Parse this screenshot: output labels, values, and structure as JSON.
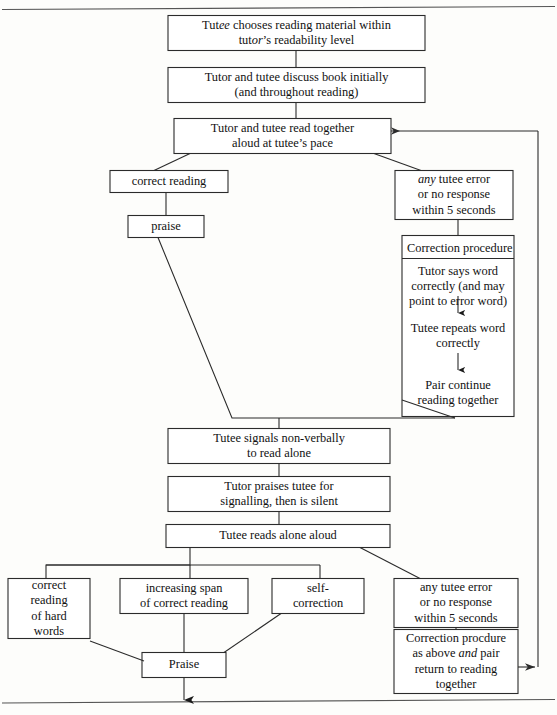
{
  "figure": {
    "line_color": "#2b2b2b",
    "box_fill": "#ffffff",
    "page_rule_color": "#555555"
  },
  "nodes": {
    "choose_material": {
      "lines": [
        "Tutee chooses reading material within",
        "tutor’s readability level"
      ],
      "line1_pre": "Tut",
      "line1_em": "ee",
      "line1_post": " chooses reading material within",
      "line2_pre": "tut",
      "line2_em": "or",
      "line2_post": "’s readability level"
    },
    "discuss_book": {
      "lines": [
        "Tutor and tutee discuss book initially",
        "(and throughout reading)"
      ]
    },
    "read_together": {
      "lines": [
        "Tutor and tutee read together",
        "aloud at tutee’s pace"
      ]
    },
    "correct_reading": {
      "lines": [
        "correct reading"
      ]
    },
    "praise_top": {
      "lines": [
        "praise"
      ]
    },
    "error_top": {
      "em": "any",
      "line1_post": " tutee error",
      "lines": [
        "any tutee error",
        "or no response",
        "within 5 seconds"
      ]
    },
    "correction_procedure": {
      "header": "Correction procedure",
      "steps": [
        [
          "Tutor says word",
          "correctly (and may",
          "point to error word)"
        ],
        [
          "Tutee repeats word",
          "correctly"
        ],
        [
          "Pair continue",
          "reading together"
        ]
      ]
    },
    "signals_nonverbally": {
      "lines": [
        "Tutee signals non-verbally",
        "to read alone"
      ]
    },
    "praises_signal": {
      "lines": [
        "Tutor praises tutee for",
        "signalling, then is silent"
      ]
    },
    "reads_alone": {
      "lines": [
        "Tutee reads alone aloud"
      ]
    },
    "hard_words": {
      "lines": [
        "correct",
        "reading",
        "of hard",
        "words"
      ]
    },
    "increasing_span": {
      "lines": [
        "increasing span",
        "of correct reading"
      ]
    },
    "self_correction": {
      "lines": [
        "self-",
        "correction"
      ]
    },
    "error_bottom": {
      "lines": [
        "any tutee error",
        "or no response",
        "within 5 seconds"
      ]
    },
    "correction_bottom": {
      "lines": [
        "Correction procdure",
        "as above and pair",
        "return to reading",
        "together"
      ],
      "line2_pre": "as above ",
      "line2_em": "and",
      "line2_post": " pair"
    },
    "praise_bottom": {
      "lines": [
        "Praise"
      ]
    }
  },
  "edges": [
    {
      "name": "choose-to-discuss",
      "kind": "vertical"
    },
    {
      "name": "discuss-to-read-together",
      "kind": "vertical"
    },
    {
      "name": "read-together-to-correct-reading",
      "kind": "diagonal"
    },
    {
      "name": "read-together-to-error-top",
      "kind": "diagonal"
    },
    {
      "name": "correct-reading-to-praise",
      "kind": "vertical"
    },
    {
      "name": "error-top-to-correction-procedure",
      "kind": "vertical"
    },
    {
      "name": "praise-to-signals",
      "kind": "diagonal-elbow"
    },
    {
      "name": "correction-procedure-to-signals",
      "kind": "diagonal-elbow"
    },
    {
      "name": "signals-to-praises-signal",
      "kind": "vertical"
    },
    {
      "name": "praises-signal-to-reads-alone",
      "kind": "vertical"
    },
    {
      "name": "reads-alone-to-bus",
      "kind": "bus"
    },
    {
      "name": "reads-alone-to-error-bottom",
      "kind": "diagonal"
    },
    {
      "name": "bus-to-hard-words",
      "kind": "vertical"
    },
    {
      "name": "bus-to-increasing-span",
      "kind": "vertical"
    },
    {
      "name": "bus-to-self-correction",
      "kind": "vertical"
    },
    {
      "name": "hard-words-to-praise-bottom",
      "kind": "diagonal"
    },
    {
      "name": "increasing-span-to-praise-bottom",
      "kind": "vertical"
    },
    {
      "name": "self-correction-to-praise-bottom",
      "kind": "diagonal"
    },
    {
      "name": "error-bottom-to-correction-bottom",
      "kind": "vertical"
    },
    {
      "name": "correction-bottom-to-feedback-loop",
      "kind": "arrow-right"
    },
    {
      "name": "feedback-loop-to-read-together",
      "kind": "arrow-left"
    },
    {
      "name": "praise-bottom-exit",
      "kind": "arrow-down"
    }
  ]
}
